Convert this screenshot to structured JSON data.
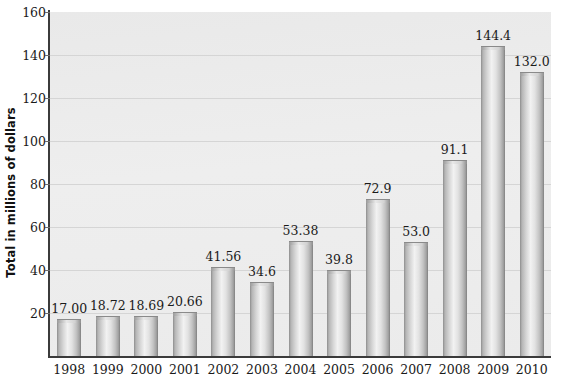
{
  "chart_data": {
    "type": "bar",
    "title": "",
    "xlabel": "",
    "ylabel": "Total in millions of dollars",
    "categories": [
      "1998",
      "1999",
      "2000",
      "2001",
      "2002",
      "2003",
      "2004",
      "2005",
      "2006",
      "2007",
      "2008",
      "2009",
      "2010"
    ],
    "values": [
      17.0,
      18.72,
      18.69,
      20.66,
      41.56,
      34.6,
      53.38,
      39.8,
      72.9,
      53.0,
      91.1,
      144.4,
      132.0
    ],
    "value_labels": [
      "17.00",
      "18.72",
      "18.69",
      "20.66",
      "41.56",
      "34.6",
      "53.38",
      "39.8",
      "72.9",
      "53.0",
      "91.1",
      "144.4",
      "132.0"
    ],
    "ylim": [
      0,
      160
    ],
    "yticks": [
      20,
      40,
      60,
      80,
      100,
      120,
      140,
      160
    ],
    "ytick_labels": [
      "20",
      "40",
      "60",
      "80",
      "100",
      "120",
      "140",
      "160"
    ],
    "grid": true,
    "grid_axis": "y",
    "legend": null,
    "legend_position": "none",
    "bar_color": "#cccccc",
    "plot_background": "#ebebeb",
    "axis_color": "#3b3b3b",
    "gridline_color": "#d5d5d5",
    "text_color": "#1a1a1a"
  }
}
